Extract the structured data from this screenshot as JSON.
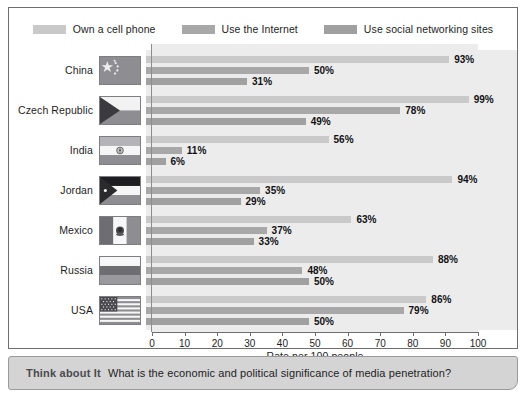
{
  "legend": {
    "items": [
      {
        "label": "Own a cell phone",
        "color": "#c9c9c9",
        "key": "cell"
      },
      {
        "label": "Use the Internet",
        "color": "#a8a8a8",
        "key": "internet"
      },
      {
        "label": "Use social networking sites",
        "color": "#a0a0a0",
        "key": "social"
      }
    ]
  },
  "axis": {
    "title": "Rate per 100 people",
    "ticks": [
      0,
      10,
      20,
      30,
      40,
      50,
      60,
      70,
      80,
      90,
      100
    ],
    "min": 0,
    "max": 100
  },
  "footer": {
    "title": "Think about It",
    "question": "What is the economic and political significance of media penetration?"
  },
  "chart_data": {
    "type": "bar",
    "orientation": "horizontal",
    "title": "",
    "xlabel": "Rate per 100 people",
    "ylabel": "",
    "xlim": [
      0,
      100
    ],
    "grid": false,
    "legend_position": "top",
    "categories": [
      "China",
      "Czech Republic",
      "India",
      "Jordan",
      "Mexico",
      "Russia",
      "USA"
    ],
    "series": [
      {
        "name": "Own a cell phone",
        "color": "#c9c9c9",
        "values": [
          93,
          99,
          56,
          94,
          63,
          88,
          86
        ]
      },
      {
        "name": "Use the Internet",
        "color": "#a8a8a8",
        "values": [
          50,
          78,
          11,
          35,
          37,
          48,
          79
        ]
      },
      {
        "name": "Use social networking sites",
        "color": "#a0a0a0",
        "values": [
          31,
          49,
          6,
          29,
          33,
          50,
          50
        ]
      }
    ],
    "value_suffix": "%",
    "rows": [
      {
        "country": "China",
        "flag": "china-flag",
        "cell": "93%",
        "internet": "50%",
        "social": "31%"
      },
      {
        "country": "Czech Republic",
        "flag": "czech-republic-flag",
        "cell": "99%",
        "internet": "78%",
        "social": "49%"
      },
      {
        "country": "India",
        "flag": "india-flag",
        "cell": "56%",
        "internet": "11%",
        "social": "6%"
      },
      {
        "country": "Jordan",
        "flag": "jordan-flag",
        "cell": "94%",
        "internet": "35%",
        "social": "29%"
      },
      {
        "country": "Mexico",
        "flag": "mexico-flag",
        "cell": "63%",
        "internet": "37%",
        "social": "33%"
      },
      {
        "country": "Russia",
        "flag": "russia-flag",
        "cell": "88%",
        "internet": "48%",
        "social": "50%"
      },
      {
        "country": "USA",
        "flag": "usa-flag",
        "cell": "86%",
        "internet": "79%",
        "social": "50%"
      }
    ]
  }
}
